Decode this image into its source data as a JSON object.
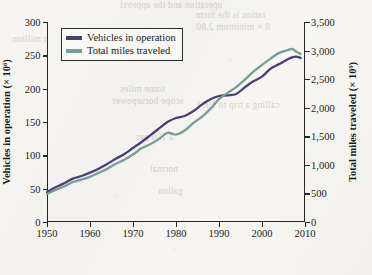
{
  "chart_data": {
    "type": "line",
    "title": "",
    "xlabel": "",
    "ylabel": "Vehicles in operation (× 10⁶)",
    "y2label": "Total miles traveled (× 10⁹)",
    "xlim": [
      1950,
      2010
    ],
    "ylim": [
      0,
      300
    ],
    "y2lim": [
      0,
      3500
    ],
    "xticks": [
      "1950",
      "1960",
      "1970",
      "1980",
      "1990",
      "2000",
      "2010"
    ],
    "xtick_values": [
      1950,
      1960,
      1970,
      1980,
      1990,
      2000,
      2010
    ],
    "yticks": [
      "0",
      "50",
      "100",
      "150",
      "200",
      "250",
      "300"
    ],
    "ytick_values": [
      0,
      50,
      100,
      150,
      200,
      250,
      300
    ],
    "y2ticks": [
      "0",
      "500",
      "1,000",
      "1,500",
      "2,000",
      "2,500",
      "3,000",
      "3,500"
    ],
    "y2tick_values": [
      0,
      500,
      1000,
      1500,
      2000,
      2500,
      3000,
      3500
    ],
    "grid": false,
    "legend_position": "upper left",
    "series": [
      {
        "name": "Vehicles in operation",
        "color": "#4b3f7a",
        "axis": "left",
        "x": [
          1950,
          1952,
          1954,
          1956,
          1958,
          1960,
          1962,
          1964,
          1966,
          1968,
          1970,
          1972,
          1974,
          1976,
          1978,
          1980,
          1982,
          1984,
          1986,
          1988,
          1990,
          1992,
          1994,
          1996,
          1998,
          2000,
          2002,
          2004,
          2006,
          2007,
          2008,
          2009
        ],
        "values": [
          45,
          52,
          58,
          65,
          69,
          74,
          80,
          87,
          95,
          102,
          111,
          120,
          130,
          140,
          150,
          156,
          159,
          166,
          176,
          184,
          189,
          190,
          192,
          202,
          211,
          218,
          230,
          237,
          244,
          247,
          248,
          246
        ]
      },
      {
        "name": "Total miles traveled",
        "color": "#7b9b9a",
        "axis": "right",
        "x": [
          1950,
          1952,
          1954,
          1956,
          1958,
          1960,
          1962,
          1964,
          1966,
          1968,
          1970,
          1972,
          1974,
          1976,
          1978,
          1980,
          1982,
          1984,
          1986,
          1988,
          1990,
          1992,
          1994,
          1996,
          1998,
          2000,
          2002,
          2004,
          2006,
          2007,
          2008,
          2009
        ],
        "values": [
          490,
          560,
          620,
          700,
          740,
          790,
          860,
          930,
          1020,
          1090,
          1180,
          1290,
          1360,
          1450,
          1560,
          1530,
          1600,
          1730,
          1840,
          1980,
          2150,
          2260,
          2360,
          2490,
          2630,
          2750,
          2860,
          2960,
          3010,
          3030,
          2980,
          2940
        ]
      }
    ]
  },
  "legend": {
    "items": [
      {
        "label": "Vehicles in operation",
        "color": "#4b3f7a"
      },
      {
        "label": "Total miles traveled",
        "color": "#7b9b9a"
      }
    ]
  },
  "bleed_through": [
    "operation and the approxi",
    "n million",
    "some   miles",
    "scope    horsepower",
    "ration is the form",
    "8 × minimum 2.80",
    "calling a  trip to 1991",
    "a 150 per",
    "normal",
    "gallon"
  ]
}
